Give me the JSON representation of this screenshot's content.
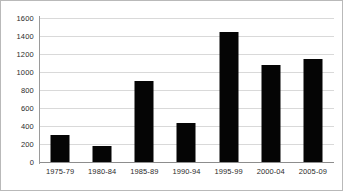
{
  "chart_data": {
    "type": "bar",
    "title": "",
    "subtitle": "",
    "xlabel": "",
    "ylabel": "",
    "categories": [
      "1975-79",
      "1980-84",
      "1985-89",
      "1990-94",
      "1995-99",
      "2000-04",
      "2005-09"
    ],
    "values": [
      300,
      175,
      900,
      430,
      1450,
      1075,
      1150
    ],
    "ylim": [
      0,
      1600
    ],
    "ytick_values": [
      0,
      200,
      400,
      600,
      800,
      1000,
      1200,
      1400,
      1600
    ],
    "ytick_labels": [
      "0",
      "200",
      "400",
      "600",
      "800",
      "1000",
      "1200",
      "1400",
      "1600"
    ],
    "grid": true,
    "grid_axis": "y",
    "legend": false,
    "legend_position": "none",
    "series": [
      {
        "name": "",
        "color": "#050505",
        "values": [
          300,
          175,
          900,
          430,
          1450,
          1075,
          1150
        ]
      }
    ]
  },
  "style": {
    "bar_color": "#050505",
    "grid_color": "#d9d9d9",
    "axis_color": "#9a9a9a",
    "baseline_color": "#8d8d8d",
    "frame_color": "#b9b9b9",
    "background": "#ffffff",
    "tick_text_color": "#2b2b2b"
  }
}
